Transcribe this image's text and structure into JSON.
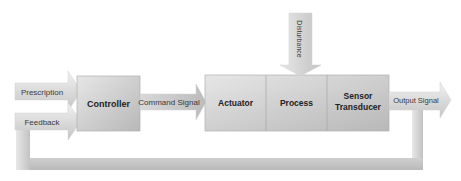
{
  "diagram": {
    "type": "block-diagram",
    "inputs": [
      {
        "id": "prescription",
        "label": "Prescription"
      },
      {
        "id": "feedback",
        "label": "Feedback"
      }
    ],
    "blocks": [
      {
        "id": "controller",
        "label": "Controller"
      },
      {
        "id": "actuator",
        "label": "Actuator"
      },
      {
        "id": "process",
        "label": "Process"
      },
      {
        "id": "sensor",
        "label_line1": "Sensor",
        "label_line2": "Transducer"
      }
    ],
    "signals": {
      "command": "Command Signal",
      "output": "Output Signal",
      "disturbance": "Disturbance"
    },
    "connections": [
      {
        "from": "prescription",
        "to": "controller"
      },
      {
        "from": "feedback",
        "to": "controller"
      },
      {
        "from": "controller",
        "to": "actuator",
        "label": "Command Signal"
      },
      {
        "from": "actuator",
        "to": "process"
      },
      {
        "from": "disturbance",
        "to": "process"
      },
      {
        "from": "process",
        "to": "sensor"
      },
      {
        "from": "sensor",
        "to": "output",
        "label": "Output Signal"
      },
      {
        "from": "output",
        "to": "feedback",
        "label": "feedback loop"
      }
    ],
    "colors": {
      "fill_light": "#eeeeee",
      "fill_dark": "#bdbdbd",
      "stroke": "#a8a8a8",
      "text": "#3a3a3a"
    }
  }
}
